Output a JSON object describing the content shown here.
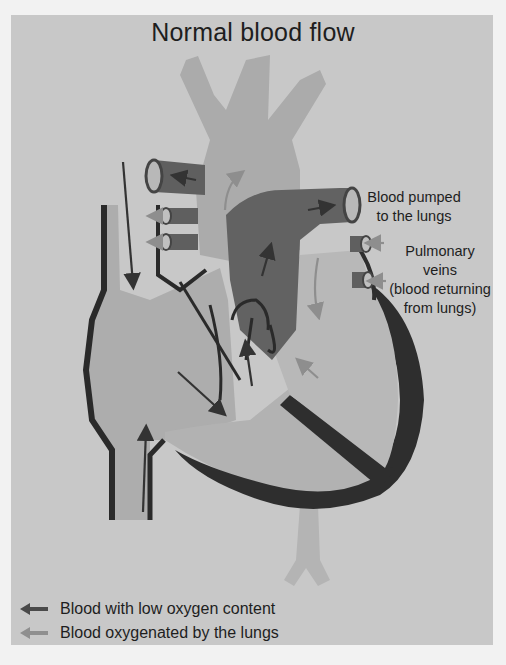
{
  "title": "Normal blood flow",
  "labels": {
    "pulmonary_artery": [
      "Blood pumped",
      "to the lungs"
    ],
    "pulmonary_veins": [
      "Pulmonary",
      "veins",
      "(blood returning",
      "from lungs)"
    ]
  },
  "legend": [
    {
      "label": "Blood with low oxygen content",
      "color": "#4a4a4a",
      "icon": "dark-arrow-left"
    },
    {
      "label": "Blood oxygenated by the lungs",
      "color": "#8f8f8f",
      "icon": "light-arrow-left"
    }
  ],
  "colors": {
    "panel_bg": "#c8c8c8",
    "page_bg": "#f2f2f2",
    "deoxygenated": "#5e5e5e",
    "oxygenated": "#a9a9a9",
    "muscle": "#2f2f2f"
  }
}
